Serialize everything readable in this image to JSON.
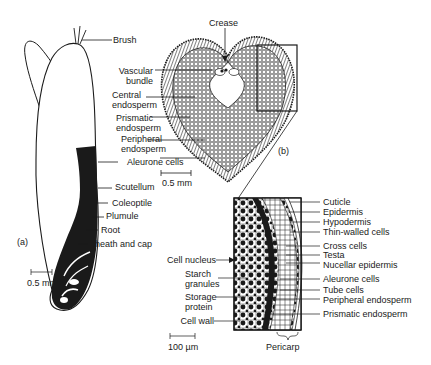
{
  "figure": {
    "panel_a": {
      "label": "(a)",
      "title": "Longitudinal section of grain",
      "labels": {
        "brush": "Brush",
        "aleurone": "Aleurone cells",
        "scutellum": "Scutellum",
        "coleoptile": "Coleoptile",
        "plumule": "Plumule",
        "root": "Root",
        "sheath": "Sheath and cap"
      },
      "scale": "0.5 mm"
    },
    "panel_b": {
      "label": "(b)",
      "title": "Transverse section of grain",
      "labels": {
        "crease": "Crease",
        "vascular_1": "Vascular",
        "vascular_2": "bundle",
        "central_1": "Central",
        "central_2": "endosperm",
        "prismatic_1": "Prismatic",
        "prismatic_2": "endosperm",
        "peripheral_1": "Peripheral",
        "peripheral_2": "endosperm"
      },
      "scale": "0.5 mm"
    },
    "panel_c": {
      "title": "Enlarged detail of outer layers",
      "right_labels": [
        "Cuticle",
        "Epidermis",
        "Hypodermis",
        "Thin-walled cells",
        "Cross cells",
        "Testa",
        "Nucellar epidermis",
        "Aleurone cells",
        "Tube cells",
        "Peripheral endosperm",
        "Prismatic endosperm"
      ],
      "left_labels": {
        "nucleus": "Cell nucleus",
        "starch_1": "Starch",
        "starch_2": "granules",
        "protein_1": "Storage",
        "protein_2": "protein",
        "wall": "Cell wall"
      },
      "bottom_label": "Pericarp",
      "scale": "100 µm"
    }
  },
  "colors": {
    "ink": "#1a1a1a",
    "background": "#ffffff"
  }
}
